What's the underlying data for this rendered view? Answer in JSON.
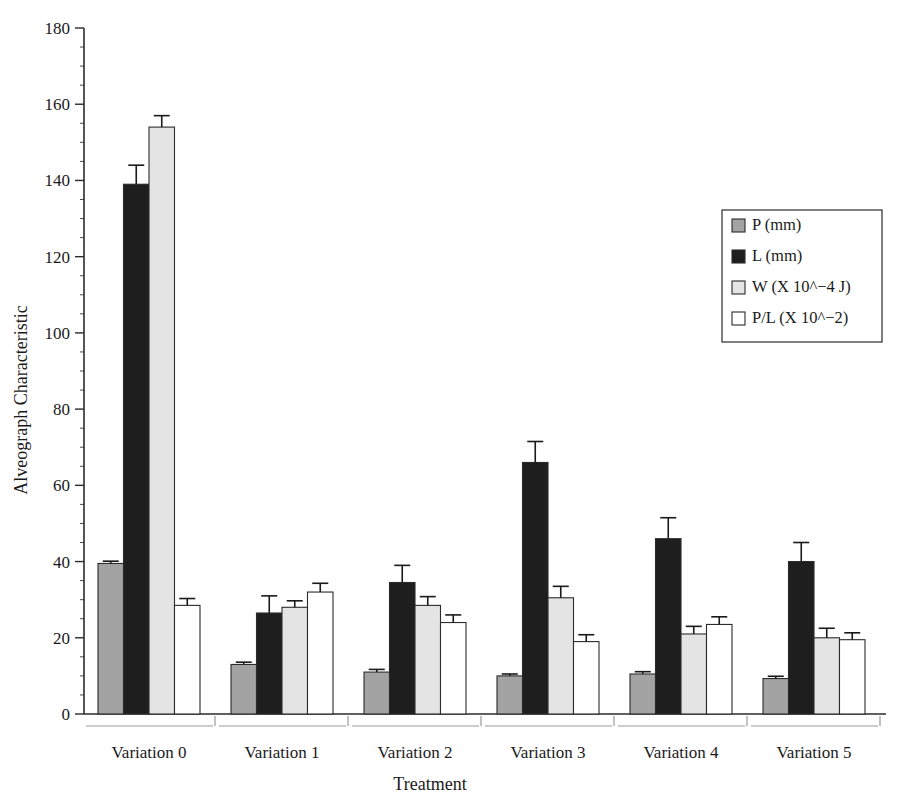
{
  "chart_data": {
    "type": "bar",
    "title": "",
    "xlabel": "Treatment",
    "ylabel": "Alveograph Characteristic",
    "categories": [
      "Variation 0",
      "Variation 1",
      "Variation 2",
      "Variation 3",
      "Variation 4",
      "Variation 5"
    ],
    "ylim": [
      0,
      180
    ],
    "yticks": [
      0,
      20,
      40,
      60,
      80,
      100,
      120,
      140,
      160,
      180
    ],
    "ytick_labels": [
      "0",
      "20",
      "40",
      "60",
      "80",
      "100",
      "120",
      "140",
      "160",
      "180"
    ],
    "minor_tick_step": 5,
    "grid": false,
    "legend_position": "right",
    "series": [
      {
        "name": "P (mm)",
        "color": "#a3a3a3",
        "values": [
          39.5,
          13.0,
          11.0,
          10.0,
          10.5,
          9.3
        ],
        "errors": [
          0.6,
          0.6,
          0.7,
          0.5,
          0.6,
          0.6
        ]
      },
      {
        "name": "L (mm)",
        "color": "#1e1e1e",
        "values": [
          139.0,
          26.5,
          34.5,
          66.0,
          46.0,
          40.0
        ],
        "errors": [
          5.0,
          4.5,
          4.5,
          5.5,
          5.5,
          5.0
        ]
      },
      {
        "name": "W (X 10^−4 J)",
        "color": "#e4e4e4",
        "values": [
          154.0,
          28.0,
          28.5,
          30.5,
          21.0,
          20.0
        ],
        "errors": [
          3.0,
          1.7,
          2.3,
          3.0,
          2.0,
          2.5
        ]
      },
      {
        "name": "P/L (X 10^−2)",
        "color": "#ffffff",
        "values": [
          28.5,
          32.0,
          24.0,
          19.0,
          23.5,
          19.5
        ]
      }
    ],
    "series_errors_pl": [
      1.8,
      2.3,
      2.0,
      1.8,
      2.0,
      1.8
    ]
  },
  "legend": {
    "entries": [
      {
        "label": "P (mm)",
        "color": "#a3a3a3"
      },
      {
        "label": "L (mm)",
        "color": "#1e1e1e"
      },
      {
        "label": "W (X 10^−4 J)",
        "color": "#e4e4e4"
      },
      {
        "label": "P/L (X 10^−2)",
        "color": "#ffffff"
      }
    ]
  },
  "axes": {
    "y_title": "Alveograph Characteristic",
    "x_title": "Treatment",
    "y_labels": [
      "180",
      "160",
      "140",
      "120",
      "100",
      "80",
      "60",
      "40",
      "20",
      "0"
    ],
    "x_labels": [
      "Variation 0",
      "Variation 1",
      "Variation 2",
      "Variation 3",
      "Variation 4",
      "Variation 5"
    ]
  }
}
